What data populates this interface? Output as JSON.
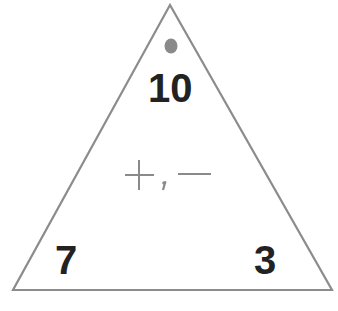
{
  "diagram": {
    "type": "fact-family-triangle",
    "top_number": "10",
    "bottom_left_number": "7",
    "bottom_right_number": "3",
    "operations": "+, −",
    "colors": {
      "outline": "#8c8c8c",
      "dot": "#8a8a8a",
      "numbers": "#222222",
      "operations": "#8a8a8a"
    }
  }
}
